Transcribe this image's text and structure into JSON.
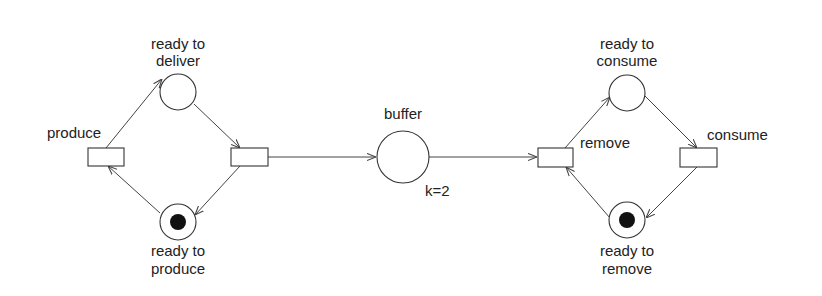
{
  "diagram": {
    "type": "petri-net",
    "title": "",
    "places": [
      {
        "id": "ready_to_deliver",
        "label_line1": "ready to",
        "label_line2": "deliver",
        "tokens": 0,
        "capacity": null
      },
      {
        "id": "ready_to_produce",
        "label_line1": "ready to",
        "label_line2": "produce",
        "tokens": 1,
        "capacity": null
      },
      {
        "id": "buffer",
        "label_line1": "buffer",
        "label_line2": "",
        "tokens": 0,
        "capacity": "k=2"
      },
      {
        "id": "ready_to_consume",
        "label_line1": "ready to",
        "label_line2": "consume",
        "tokens": 0,
        "capacity": null
      },
      {
        "id": "ready_to_remove",
        "label_line1": "ready to",
        "label_line2": "remove",
        "tokens": 1,
        "capacity": null
      }
    ],
    "transitions": [
      {
        "id": "produce",
        "label": "produce"
      },
      {
        "id": "deliver",
        "label": ""
      },
      {
        "id": "remove",
        "label": "remove"
      },
      {
        "id": "consume",
        "label": "consume"
      }
    ],
    "arcs": [
      {
        "from": "produce",
        "to": "ready_to_deliver"
      },
      {
        "from": "ready_to_deliver",
        "to": "deliver"
      },
      {
        "from": "deliver",
        "to": "ready_to_produce"
      },
      {
        "from": "ready_to_produce",
        "to": "produce"
      },
      {
        "from": "deliver",
        "to": "buffer"
      },
      {
        "from": "buffer",
        "to": "remove"
      },
      {
        "from": "remove",
        "to": "ready_to_consume"
      },
      {
        "from": "ready_to_consume",
        "to": "consume"
      },
      {
        "from": "consume",
        "to": "ready_to_remove"
      },
      {
        "from": "ready_to_remove",
        "to": "remove"
      }
    ],
    "colors": {
      "stroke": "#333333",
      "token": "#111111",
      "background": "#ffffff"
    }
  }
}
